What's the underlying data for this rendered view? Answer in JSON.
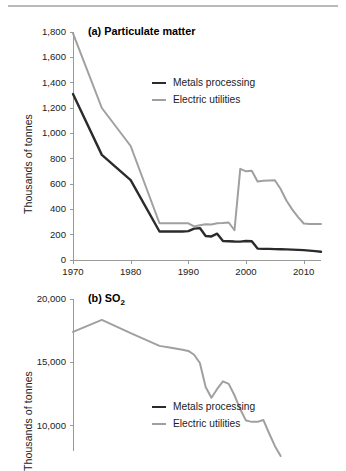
{
  "figure": {
    "rule_present": true
  },
  "chart_data": [
    {
      "id": "a",
      "type": "line",
      "title": "(a) Particulate matter",
      "title_prefix": "(a) Particulate matter",
      "xlabel": "",
      "ylabel": "Thousands of tonnes",
      "xlim": [
        1970,
        2013
      ],
      "ylim": [
        0,
        1800
      ],
      "ytick_values": [
        0,
        200,
        400,
        600,
        800,
        1000,
        1200,
        1400,
        1600,
        1800
      ],
      "ytick_labels": [
        "0",
        "200",
        "400",
        "600",
        "800",
        "1,000",
        "1,200",
        "1,400",
        "1,600",
        "1,800"
      ],
      "xtick_values": [
        1970,
        1980,
        1990,
        2000,
        2010
      ],
      "xtick_labels": [
        "1970",
        "1980",
        "1990",
        "2000",
        "2010"
      ],
      "grid": false,
      "legend_position": "upper-center",
      "series": [
        {
          "name": "Metals processing",
          "color": "#2b2b2b",
          "width": 2.4,
          "x": [
            1970,
            1975,
            1980,
            1985,
            1986,
            1987,
            1988,
            1989,
            1990,
            1991,
            1992,
            1993,
            1994,
            1995,
            1996,
            1997,
            1998,
            1999,
            2000,
            2001,
            2002,
            2003,
            2004,
            2005,
            2006,
            2007,
            2008,
            2009,
            2010,
            2011,
            2012,
            2013
          ],
          "values": [
            1310,
            830,
            630,
            225,
            225,
            225,
            225,
            225,
            228,
            248,
            252,
            190,
            186,
            208,
            150,
            148,
            146,
            145,
            150,
            148,
            90,
            88,
            88,
            86,
            85,
            84,
            82,
            80,
            78,
            74,
            70,
            65
          ]
        },
        {
          "name": "Electric utilities",
          "color": "#a0a0a0",
          "width": 2.0,
          "x": [
            1970,
            1975,
            1980,
            1985,
            1986,
            1987,
            1988,
            1989,
            1990,
            1991,
            1992,
            1993,
            1994,
            1995,
            1996,
            1997,
            1998,
            1999,
            2000,
            2001,
            2002,
            2003,
            2004,
            2005,
            2006,
            2007,
            2008,
            2009,
            2010,
            2011,
            2012,
            2013
          ],
          "values": [
            1790,
            1200,
            900,
            290,
            290,
            290,
            290,
            290,
            290,
            265,
            275,
            282,
            280,
            290,
            292,
            296,
            235,
            720,
            700,
            705,
            620,
            625,
            628,
            630,
            560,
            470,
            400,
            340,
            288,
            285,
            285,
            285
          ]
        }
      ]
    },
    {
      "id": "b",
      "type": "line",
      "title": "(b) SO2",
      "title_main": "(b) SO",
      "title_sub": "2",
      "xlabel": "",
      "ylabel": "Thousands of tonnes",
      "ylim": [
        8000,
        20000
      ],
      "ytick_values": [
        10000,
        15000,
        20000
      ],
      "ytick_labels": [
        "10,000",
        "15,000",
        "20,000"
      ],
      "xlim": [
        1970,
        2013
      ],
      "grid": false,
      "legend_position": "lower-center",
      "series": [
        {
          "name": "Metals processing",
          "color": "#2b2b2b",
          "width": 2.4,
          "x": [],
          "values": []
        },
        {
          "name": "Electric utilities",
          "color": "#a0a0a0",
          "width": 2.0,
          "x": [
            1970,
            1975,
            1980,
            1985,
            1987,
            1989,
            1990,
            1991,
            1992,
            1993,
            1994,
            1995,
            1996,
            1997,
            1998,
            1999,
            2000,
            2001,
            2002,
            2003,
            2004,
            2005,
            2006
          ],
          "values": [
            17400,
            18350,
            17300,
            16300,
            16150,
            16000,
            15900,
            15600,
            14950,
            13050,
            12200,
            12900,
            13500,
            13300,
            12400,
            11300,
            10400,
            10300,
            10300,
            10450,
            9400,
            8400,
            7600
          ]
        }
      ]
    }
  ]
}
